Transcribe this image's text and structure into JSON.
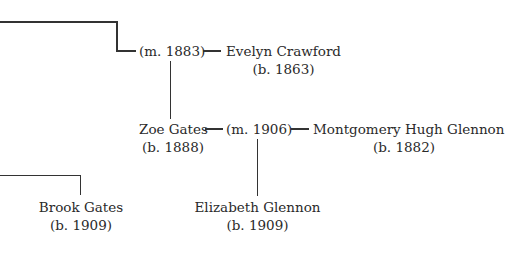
{
  "tree": {
    "couple1": {
      "marriage": "(m. 1883)",
      "spouse": {
        "name": "Evelyn Crawford",
        "born": "(b. 1863)"
      }
    },
    "couple2": {
      "person": {
        "name": "Zoe Gates",
        "born": "(b. 1888)"
      },
      "marriage": "(m. 1906)",
      "spouse": {
        "name": "Montgomery Hugh Glennon",
        "born": "(b. 1882)"
      }
    },
    "children": [
      {
        "name": "Brook Gates",
        "born": "(b. 1909)"
      },
      {
        "name": "Elizabeth Glennon",
        "born": "(b. 1909)"
      }
    ]
  }
}
